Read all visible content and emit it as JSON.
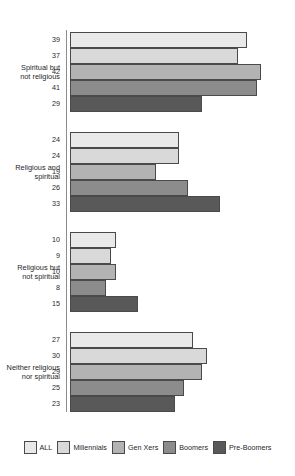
{
  "chart_data": {
    "type": "bar",
    "orientation": "horizontal",
    "title": "",
    "subtitle": "",
    "xlabel": "",
    "ylabel": "",
    "grid": false,
    "legend_position": "bottom",
    "xlim": [
      0,
      45
    ],
    "categories": [
      "Spiritual but\nnot religious",
      "Religious and\nspiritual",
      "Religious but\nnot spiritual",
      "Neither religious\nnor spiritual"
    ],
    "series": [
      {
        "name": "ALL",
        "color": "#e9e9e9",
        "values": [
          39,
          24,
          10,
          27
        ]
      },
      {
        "name": "Millennials",
        "color": "#d9d9d9",
        "values": [
          37,
          24,
          9,
          30
        ]
      },
      {
        "name": "Gen Xers",
        "color": "#b3b3b3",
        "values": [
          42,
          19,
          10,
          29
        ]
      },
      {
        "name": "Boomers",
        "color": "#8c8c8c",
        "values": [
          41,
          26,
          8,
          25
        ]
      },
      {
        "name": "Pre-Boomers",
        "color": "#595959",
        "values": [
          29,
          33,
          15,
          23
        ]
      }
    ]
  },
  "legend": {
    "entries": [
      {
        "label": "ALL",
        "color": "#e9e9e9"
      },
      {
        "label": "Millennials",
        "color": "#d9d9d9"
      },
      {
        "label": "Gen Xers",
        "color": "#b3b3b3"
      },
      {
        "label": "Boomers",
        "color": "#8c8c8c"
      },
      {
        "label": "Pre-Boomers",
        "color": "#595959"
      }
    ]
  },
  "axis": {
    "line_color": "#8c8c8c",
    "bar_border_color": "#4a4a4a"
  }
}
